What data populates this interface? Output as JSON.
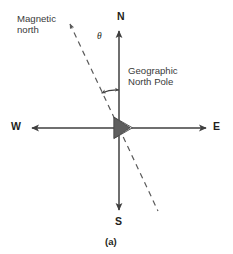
{
  "figure": {
    "caption": "(a)",
    "title_alt": "Magnetic declination of a compass needle relative to geographic north"
  },
  "labels": {
    "magnetic_north": "Magnetic\nnorth",
    "geographic_north_pole": "Geographic\nNorth Pole",
    "angle_symbol": "θ",
    "compass_n": "N",
    "compass_s": "S",
    "compass_w": "W",
    "compass_e": "E"
  },
  "colors": {
    "axis": "#3f3f3f",
    "dashed_line": "#5a5a5a",
    "needle_dark": "#5e5e5e",
    "needle_light": "#e8e8e8",
    "needle_outline": "#4a4a4a",
    "text_bold": "#231f20",
    "text_plain": "#3a3a3a",
    "background": "#ffffff"
  },
  "geometry": {
    "origin_x": 119,
    "origin_y": 128,
    "north_tip_y": 29,
    "south_tip_y": 212,
    "west_tip_x": 30,
    "east_tip_x": 208,
    "dashed_top_x": 68,
    "dashed_top_y": 22,
    "dashed_bottom_x": 158,
    "dashed_bottom_y": 211,
    "arc_radius": 38,
    "declination_angle_deg": 25
  }
}
